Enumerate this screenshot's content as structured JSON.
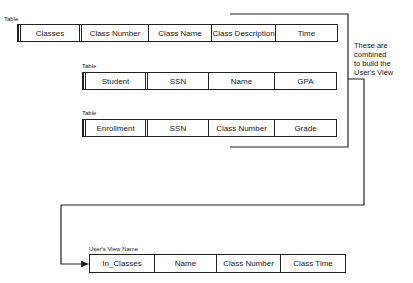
{
  "tables": [
    {
      "label": "Table",
      "cells": [
        "Classes",
        "Class Number",
        "Class Name",
        "Class Description",
        "Time"
      ]
    },
    {
      "label": "Table",
      "cells": [
        "Student",
        "SSN",
        "Name",
        "GPA"
      ]
    },
    {
      "label": "Table",
      "cells": [
        "Enrollment",
        "SSN",
        "Class Number",
        "Grade"
      ]
    }
  ],
  "view": {
    "label": "User's View Name",
    "cells": [
      "In_Classes",
      "Name",
      "Class Number",
      "Class Time"
    ]
  },
  "annotation": {
    "lines": [
      "These are",
      "combined",
      "to build the",
      "User's View"
    ]
  }
}
